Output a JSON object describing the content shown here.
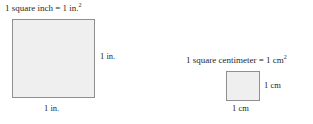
{
  "figure": {
    "background_color": "#ffffff",
    "square_fill_color": "#efefef",
    "square_border_color": "#8f8f8f",
    "text_color": "#1f1f1f"
  },
  "inch_unit": {
    "caption_text": "1 square inch = 1 in.",
    "caption_exponent": "2",
    "side_label": "1 in.",
    "bottom_label": "1 in."
  },
  "centimeter_unit": {
    "caption_text": "1 square centimeter = 1 cm",
    "caption_exponent": "2",
    "side_label": "1 cm",
    "bottom_label": "1 cm"
  },
  "chart_data": {
    "type": "diagram",
    "items": [
      {
        "name": "square inch",
        "equation": "1 square inch = 1 in.²",
        "width_label": "1 in.",
        "height_label": "1 in.",
        "rendered_width_px": 83,
        "rendered_height_px": 79
      },
      {
        "name": "square centimeter",
        "equation": "1 square centimeter = 1 cm²",
        "width_label": "1 cm",
        "height_label": "1 cm",
        "rendered_width_px": 34,
        "rendered_height_px": 30
      }
    ]
  }
}
